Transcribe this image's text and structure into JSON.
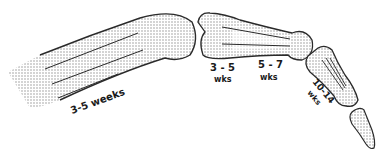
{
  "diagram": {
    "labels": {
      "metacarpal": "3-5 weeks",
      "proximal_base_top": "3 - 5",
      "proximal_base_bottom": "wks",
      "proximal_head_top": "5 - 7",
      "proximal_head_bottom": "wks",
      "middle_top": "10-14",
      "middle_bottom": "wks"
    },
    "colors": {
      "outline": "#2a2a2a",
      "stipple": "#9a9a9a",
      "text": "#1a1a1a"
    }
  }
}
